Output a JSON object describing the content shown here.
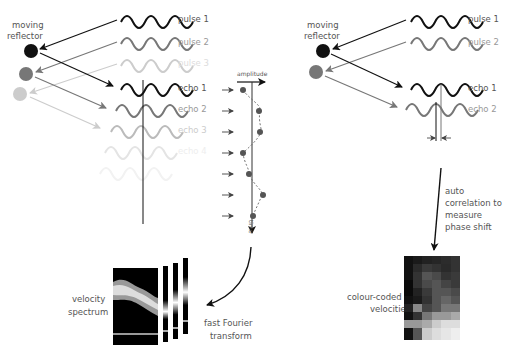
{
  "left": {
    "reflector_label_1": "moving",
    "reflector_label_2": "reflector",
    "pulses": [
      {
        "label": "pulse 1",
        "color": "#111111"
      },
      {
        "label": "pulse 2",
        "color": "#777777"
      },
      {
        "label": "pulse 3",
        "color": "#cccccc"
      }
    ],
    "echoes": [
      {
        "label": "echo 1",
        "color": "#111111"
      },
      {
        "label": "echo 2",
        "color": "#777777"
      },
      {
        "label": "echo 3",
        "color": "#bbbbbb"
      },
      {
        "label": "echo 4",
        "color": "#e4e4e4"
      }
    ],
    "amplitude_label": "amplitude",
    "time_label": "time",
    "velocity_spectrum_1": "velocity",
    "velocity_spectrum_2": "spectrum",
    "fft_1": "fast Fourier",
    "fft_2": "transform"
  },
  "right": {
    "reflector_label_1": "moving",
    "reflector_label_2": "reflector",
    "pulses": [
      {
        "label": "pulse 1",
        "color": "#111111"
      },
      {
        "label": "pulse 2",
        "color": "#777777"
      }
    ],
    "echoes": [
      {
        "label": "echo 1",
        "color": "#111111"
      },
      {
        "label": "echo 2",
        "color": "#777777"
      }
    ],
    "auto_1": "auto",
    "auto_2": "correlation to",
    "auto_3": "measure",
    "auto_4": "phase shift",
    "colour_1": "colour-coded",
    "colour_2": "velocities"
  }
}
